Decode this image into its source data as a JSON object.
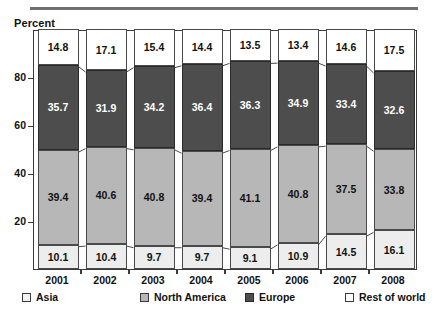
{
  "axis": {
    "y_title": "Percent",
    "y_ticks": [
      "20",
      "40",
      "60",
      "80"
    ]
  },
  "legend": {
    "items": [
      {
        "label": "Asia",
        "key": "asia",
        "color": "#EDEDED"
      },
      {
        "label": "North America",
        "key": "na",
        "color": "#B7B7B7"
      },
      {
        "label": "Europe",
        "key": "eu",
        "color": "#4D4D4D"
      },
      {
        "label": "Rest of world",
        "key": "row",
        "color": "#FFFFFF"
      }
    ]
  },
  "chart_data": {
    "type": "bar",
    "title": "",
    "subtitle": "",
    "xlabel": "",
    "ylabel": "Percent",
    "ylim": [
      0,
      100
    ],
    "yticks": [
      20,
      40,
      60,
      80
    ],
    "grid": false,
    "stacked": true,
    "stack_order_bottom_up": [
      "Asia",
      "North America",
      "Europe",
      "Rest of world"
    ],
    "legend_position": "bottom",
    "categories": [
      "2001",
      "2002",
      "2003",
      "2004",
      "2005",
      "2006",
      "2007",
      "2008"
    ],
    "series": [
      {
        "name": "Asia",
        "color": "#EDEDED",
        "values": [
          10.1,
          10.4,
          9.7,
          9.7,
          9.1,
          10.9,
          14.5,
          16.1
        ]
      },
      {
        "name": "North America",
        "color": "#B7B7B7",
        "values": [
          39.4,
          40.6,
          40.8,
          39.4,
          41.1,
          40.8,
          37.5,
          33.8
        ]
      },
      {
        "name": "Europe",
        "color": "#4D4D4D",
        "values": [
          35.7,
          31.9,
          34.2,
          36.4,
          36.3,
          34.9,
          33.4,
          32.6
        ]
      },
      {
        "name": "Rest of world",
        "color": "#FFFFFF",
        "values": [
          14.8,
          17.1,
          15.4,
          14.4,
          13.5,
          13.4,
          14.6,
          17.5
        ]
      }
    ]
  }
}
